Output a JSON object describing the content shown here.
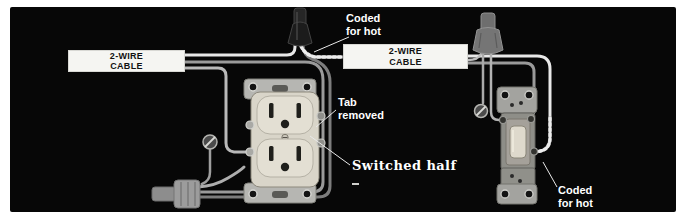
{
  "diagram": {
    "cable_label_1": {
      "line1": "2-WIRE",
      "line2": "CABLE"
    },
    "cable_label_2": {
      "line1": "2-WIRE",
      "line2": "CABLE"
    },
    "callout_coded_top": {
      "line1": "Coded",
      "line2": "for hot"
    },
    "callout_tab": {
      "line1": "Tab",
      "line2": "removed"
    },
    "callout_switched": "Switched half",
    "callout_coded_right": {
      "line1": "Coded",
      "line2": "for hot"
    }
  },
  "colors": {
    "page_bg": "#ffffff",
    "panel_bg": "#070707",
    "cable_box_bg": "#f5f5f2",
    "cable_box_text": "#111111",
    "callout_text": "#ffffff",
    "wire_bright": "#e8e8e8",
    "wire_mid": "#b9b9b9",
    "wire_dark": "#8f8f8f",
    "device_body": "#d9d5c9",
    "metal_strap": "#b6b6b2"
  }
}
